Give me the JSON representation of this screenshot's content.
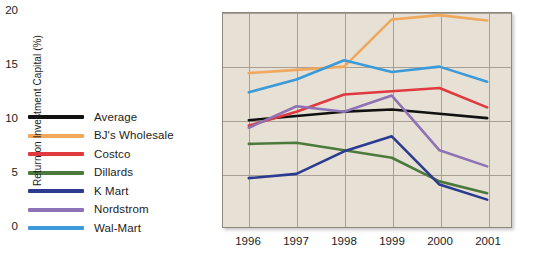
{
  "legend": {
    "position": "left",
    "items": [
      {
        "label": "Average",
        "color": "#111111"
      },
      {
        "label": "BJ's Wholesale",
        "color": "#efa85c"
      },
      {
        "label": "Costco",
        "color": "#e03a40"
      },
      {
        "label": "Dillards",
        "color": "#4c7a3c"
      },
      {
        "label": "K Mart",
        "color": "#2b3b8f"
      },
      {
        "label": "Nordstrom",
        "color": "#8d72b5"
      },
      {
        "label": "Wal-Mart",
        "color": "#3d9ad9"
      }
    ]
  },
  "chart_data": {
    "type": "line",
    "title": "",
    "xlabel": "",
    "ylabel": "Return on Investment Capital (%)",
    "categories": [
      "1996",
      "1997",
      "1998",
      "1999",
      "2000",
      "2001"
    ],
    "x": [
      1996,
      1997,
      1998,
      1999,
      2000,
      2001
    ],
    "ylim": [
      0,
      20
    ],
    "yticks": [
      0,
      5,
      10,
      15,
      20
    ],
    "grid": true,
    "legend_position": "left-outside",
    "plot_background": "#e7e0d4",
    "grid_color": "#a79f93",
    "series": [
      {
        "name": "Average",
        "color": "#111111",
        "values": [
          10.0,
          10.4,
          10.8,
          11.0,
          10.6,
          10.2
        ]
      },
      {
        "name": "BJ's Wholesale",
        "color": "#efa85c",
        "values": [
          14.4,
          14.7,
          15.0,
          19.4,
          19.8,
          19.3
        ]
      },
      {
        "name": "Costco",
        "color": "#e03a40",
        "values": [
          9.5,
          10.8,
          12.4,
          12.7,
          13.0,
          11.2
        ]
      },
      {
        "name": "Dillards",
        "color": "#4c7a3c",
        "values": [
          7.8,
          7.9,
          7.2,
          6.5,
          4.3,
          3.2
        ]
      },
      {
        "name": "K Mart",
        "color": "#2b3b8f",
        "values": [
          4.6,
          5.0,
          7.1,
          8.5,
          4.0,
          2.6
        ]
      },
      {
        "name": "Nordstrom",
        "color": "#8d72b5",
        "values": [
          9.3,
          11.3,
          10.8,
          12.3,
          7.2,
          5.7
        ]
      },
      {
        "name": "Wal-Mart",
        "color": "#3d9ad9",
        "values": [
          12.6,
          13.8,
          15.6,
          14.5,
          15.0,
          13.6
        ]
      }
    ]
  }
}
